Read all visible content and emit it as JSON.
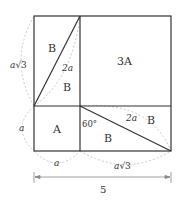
{
  "labels": {
    "region_b_top_left": "B",
    "region_b_top_right": "B",
    "region_3a": "3A",
    "region_a": "A",
    "region_b_bottom": "B",
    "region_b_bottom_right": "B",
    "hyp_top": "2a",
    "hyp_bottom": "2a",
    "side_left_top_a": "a",
    "side_left_top_rest": "√3",
    "side_left_bottom": "a",
    "side_bottom_left": "a",
    "side_bottom_right_a": "a",
    "side_bottom_right_rest": "√3",
    "angle": "60°",
    "dimension": "5"
  },
  "colors": {
    "line": "#333333",
    "dashed": "#bbbbbb"
  }
}
